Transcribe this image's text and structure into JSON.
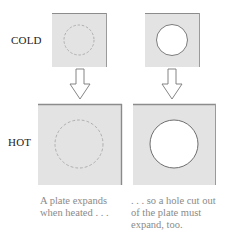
{
  "labels": {
    "cold": "COLD",
    "hot": "HOT"
  },
  "captions": {
    "left": [
      "A plate expands",
      "when heated . . ."
    ],
    "right": [
      ". . . so a hole cut out",
      "of the plate must",
      "expand, too."
    ]
  },
  "colors": {
    "plate_fill": "#e3e3e3",
    "plate_edge": "#8c8c8c",
    "dashed_circle": "#a8a8a8",
    "hole_fill": "#ffffff",
    "hole_edge": "#6e6e6e",
    "arrow_stroke": "#777777"
  },
  "panels": [
    {
      "name": "cold-plate",
      "state": "cold",
      "hole": false
    },
    {
      "name": "cold-plate-with-hole",
      "state": "cold",
      "hole": true
    },
    {
      "name": "hot-plate",
      "state": "hot",
      "hole": false
    },
    {
      "name": "hot-plate-with-hole",
      "state": "hot",
      "hole": true
    }
  ]
}
